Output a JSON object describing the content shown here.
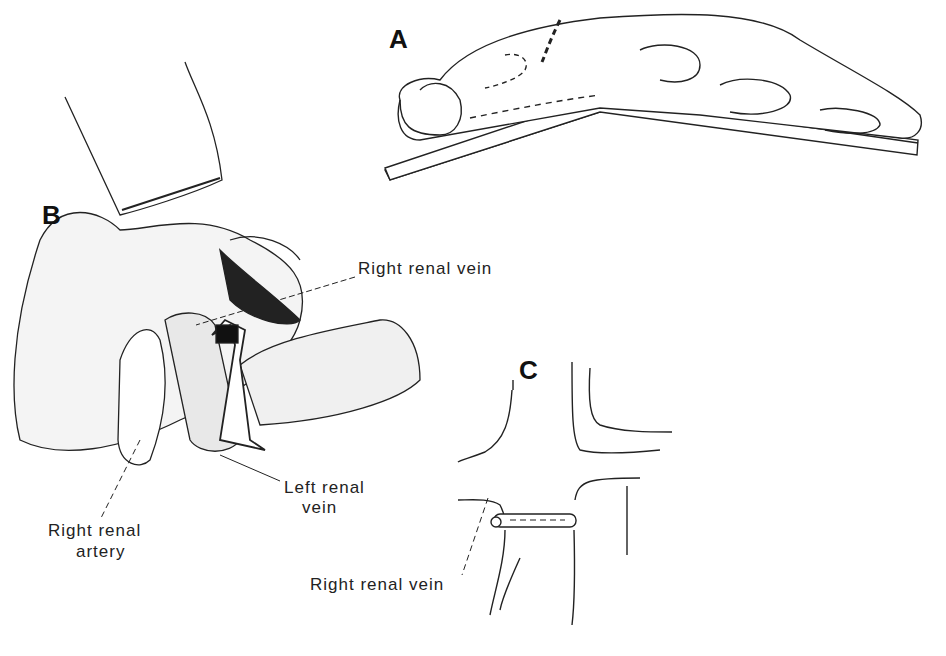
{
  "panels": {
    "a": "A",
    "b": "B",
    "c": "C"
  },
  "labels": {
    "right_renal_vein_b": "Right renal vein",
    "left_renal_vein_line1": "Left renal",
    "left_renal_vein_line2": "vein",
    "right_renal_artery_line1": "Right renal",
    "right_renal_artery_line2": "artery",
    "right_renal_vein_c": "Right renal vein"
  }
}
